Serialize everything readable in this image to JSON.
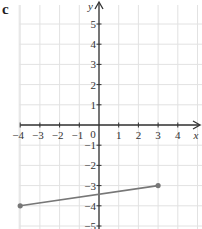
{
  "part_label": "c",
  "chart_data": {
    "type": "line",
    "title": "",
    "xlabel": "x",
    "ylabel": "y",
    "xlim": [
      -4,
      4
    ],
    "ylim": [
      -5,
      5
    ],
    "grid": true,
    "x_ticks": [
      "-4",
      "-3",
      "-2",
      "-1",
      "0",
      "1",
      "2",
      "3",
      "4"
    ],
    "y_ticks": [
      "5",
      "4",
      "3",
      "2",
      "1",
      "-1",
      "-2",
      "-3",
      "-4",
      "-5"
    ],
    "origin_label": "0",
    "series": [
      {
        "name": "line segment",
        "points": [
          [
            -4,
            -4
          ],
          [
            3,
            -3
          ]
        ],
        "color": "#777777",
        "endpoints": "filled-dots"
      }
    ]
  },
  "colors": {
    "grid": "#e2e2e2",
    "axis": "#333333",
    "segment": "#777777"
  }
}
